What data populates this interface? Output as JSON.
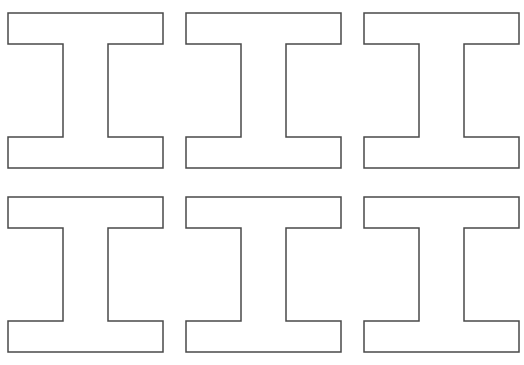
{
  "canvas": {
    "width": 524,
    "height": 365,
    "background_color": "#ffffff",
    "description": "Worksheet sheet with six identical outlined serif capital I / I-beam shapes arranged in a 2 row by 3 column grid"
  },
  "style": {
    "stroke_color": "#4a4a4a",
    "fill_color": "#ffffff",
    "stroke_width": 1.5
  },
  "grid": {
    "rows": 2,
    "columns": 3,
    "column_gap": 23,
    "row_gap": 29,
    "origin_x": 8,
    "origin_y": 13,
    "cell_width": 155,
    "cell_height": 155
  },
  "shape": {
    "name": "serif-capital-i",
    "label": "I",
    "outline_points": "0,0 155,0 155,31 100,31 100,124 155,124 155,155 0,155 0,124 55,124 55,31 0,31",
    "flange_height": 31,
    "stem_inset_left": 55,
    "stem_inset_right": 55,
    "stem_width": 45,
    "viewbox": "0 0 155 155"
  },
  "shapes": [
    {
      "id": "ibeam-1",
      "row": 0,
      "col": 0,
      "x": 8,
      "y": 13,
      "width": 155,
      "height": 155
    },
    {
      "id": "ibeam-2",
      "row": 0,
      "col": 1,
      "x": 186,
      "y": 13,
      "width": 155,
      "height": 155
    },
    {
      "id": "ibeam-3",
      "row": 0,
      "col": 2,
      "x": 364,
      "y": 13,
      "width": 155,
      "height": 155
    },
    {
      "id": "ibeam-4",
      "row": 1,
      "col": 0,
      "x": 8,
      "y": 197,
      "width": 155,
      "height": 155
    },
    {
      "id": "ibeam-5",
      "row": 1,
      "col": 1,
      "x": 186,
      "y": 197,
      "width": 155,
      "height": 155
    },
    {
      "id": "ibeam-6",
      "row": 1,
      "col": 2,
      "x": 364,
      "y": 197,
      "width": 155,
      "height": 155
    }
  ]
}
